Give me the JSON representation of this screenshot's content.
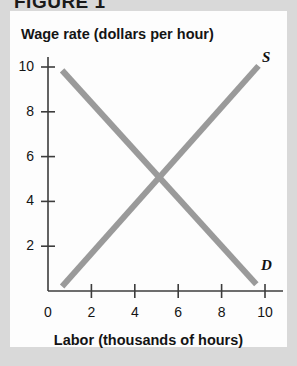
{
  "figure": {
    "caption": "FIGURE 1"
  },
  "chart_data": {
    "type": "line",
    "title": "",
    "xlabel": "Labor (thousands of hours)",
    "ylabel": "Wage rate (dollars per hour)",
    "xlim": [
      0,
      10.8
    ],
    "ylim": [
      0,
      10.8
    ],
    "xticks": [
      "0",
      "2",
      "4",
      "6",
      "8",
      "10"
    ],
    "xtick_values": [
      0,
      2,
      4,
      6,
      8,
      10
    ],
    "yticks": [
      "2",
      "4",
      "6",
      "8",
      "10"
    ],
    "ytick_values": [
      2,
      4,
      6,
      8,
      10
    ],
    "grid": false,
    "legend": "inline-curve-labels",
    "line_color": "#9a9a9a",
    "axis_color": "#3c3c3c",
    "series": [
      {
        "name": "S",
        "label": "S",
        "role": "supply",
        "x": [
          0.65,
          9.7
        ],
        "y": [
          0.2,
          10.05
        ],
        "points": [
          [
            0.65,
            0.2
          ],
          [
            9.7,
            10.05
          ]
        ]
      },
      {
        "name": "D",
        "label": "D",
        "role": "demand",
        "x": [
          0.65,
          9.6
        ],
        "y": [
          9.85,
          0.3
        ],
        "points": [
          [
            0.65,
            9.85
          ],
          [
            9.6,
            0.3
          ]
        ]
      }
    ],
    "annotations": [
      {
        "text": "S",
        "x": 10.05,
        "y": 10.35
      },
      {
        "text": "D",
        "x": 10.0,
        "y": 1.05
      }
    ],
    "equilibrium": {
      "x": 5.0,
      "y": 5.0
    }
  }
}
